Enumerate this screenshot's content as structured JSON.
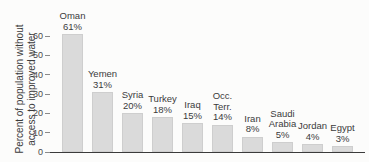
{
  "chart_data": {
    "type": "bar",
    "title": "",
    "ylabel_lines": [
      "Percent of population without",
      "access to improved water"
    ],
    "ylabel": "Percent of population without access to improved water",
    "xlabel": "",
    "ylim": [
      0,
      66
    ],
    "yticks": [
      0,
      10,
      20,
      30,
      40,
      50,
      60
    ],
    "grid": false,
    "legend": "none",
    "categories": [
      "Oman",
      "Yemen",
      "Syria",
      "Turkey",
      "Iraq",
      "Occ. Terr.",
      "Iran",
      "Saudi Arabia",
      "Jordan",
      "Egypt"
    ],
    "values": [
      61,
      31,
      20,
      18,
      15,
      14,
      8,
      5,
      4,
      3
    ],
    "bars": [
      {
        "label_lines": [
          "Oman"
        ],
        "pct": "61%",
        "value": 61
      },
      {
        "label_lines": [
          "Yemen"
        ],
        "pct": "31%",
        "value": 31
      },
      {
        "label_lines": [
          "Syria"
        ],
        "pct": "20%",
        "value": 20
      },
      {
        "label_lines": [
          "Turkey"
        ],
        "pct": "18%",
        "value": 18
      },
      {
        "label_lines": [
          "Iraq"
        ],
        "pct": "15%",
        "value": 15
      },
      {
        "label_lines": [
          "Occ.",
          "Terr."
        ],
        "pct": "14%",
        "value": 14
      },
      {
        "label_lines": [
          "Iran"
        ],
        "pct": "8%",
        "value": 8
      },
      {
        "label_lines": [
          "Saudi",
          "Arabia"
        ],
        "pct": "5%",
        "value": 5
      },
      {
        "label_lines": [
          "Jordan"
        ],
        "pct": "4%",
        "value": 4
      },
      {
        "label_lines": [
          "Egypt"
        ],
        "pct": "3%",
        "value": 3
      }
    ],
    "colors": {
      "bar_fill": "#dadada",
      "axis_line": "#3b3b3b",
      "tick_mark": "#8a8a8a",
      "text": "#3b3b3b",
      "background": "#fcfcfb"
    }
  }
}
